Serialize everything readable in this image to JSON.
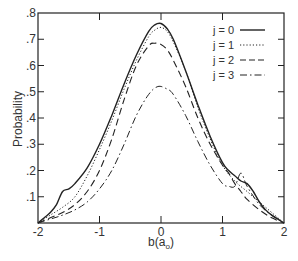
{
  "chart_data": {
    "type": "line",
    "title": "",
    "xlabel": "b(a₀)",
    "xlabel_main": "b(a",
    "xlabel_sub": "o",
    "xlabel_close": ")",
    "ylabel": "Probability",
    "xlim": [
      -2,
      2
    ],
    "ylim": [
      0,
      0.8
    ],
    "x_ticks": [
      -2,
      -1,
      0,
      1,
      2
    ],
    "x_tick_labels": [
      "-2",
      "-1",
      "0",
      "1",
      "2"
    ],
    "y_ticks": [
      0.1,
      0.2,
      0.3,
      0.4,
      0.5,
      0.6,
      0.7,
      0.8
    ],
    "y_tick_labels": [
      ".1",
      ".2",
      ".3",
      ".4",
      ".5",
      ".6",
      ".7",
      ".8"
    ],
    "grid": false,
    "legend_position": "top-right",
    "series": [
      {
        "name": "j = 0",
        "style": "solid",
        "x": [
          -2.0,
          -1.9,
          -1.8,
          -1.7,
          -1.6,
          -1.5,
          -1.4,
          -1.2,
          -1.0,
          -0.8,
          -0.6,
          -0.4,
          -0.2,
          -0.1,
          0.0,
          0.1,
          0.2,
          0.4,
          0.6,
          0.8,
          1.0,
          1.1,
          1.2,
          1.3,
          1.4,
          1.5,
          1.6,
          1.7,
          1.8,
          1.9,
          2.0
        ],
        "y": [
          0.0,
          0.02,
          0.04,
          0.07,
          0.12,
          0.13,
          0.15,
          0.21,
          0.3,
          0.41,
          0.53,
          0.64,
          0.73,
          0.755,
          0.76,
          0.74,
          0.7,
          0.58,
          0.45,
          0.33,
          0.23,
          0.2,
          0.18,
          0.16,
          0.15,
          0.12,
          0.08,
          0.05,
          0.03,
          0.015,
          0.0
        ]
      },
      {
        "name": "j = 1",
        "style": "dotted",
        "x": [
          -2.0,
          -1.8,
          -1.6,
          -1.4,
          -1.2,
          -1.0,
          -0.8,
          -0.6,
          -0.4,
          -0.2,
          -0.1,
          0.0,
          0.1,
          0.2,
          0.4,
          0.6,
          0.8,
          1.0,
          1.2,
          1.4,
          1.6,
          1.8,
          2.0
        ],
        "y": [
          0.0,
          0.03,
          0.06,
          0.1,
          0.18,
          0.28,
          0.39,
          0.51,
          0.62,
          0.71,
          0.735,
          0.745,
          0.73,
          0.69,
          0.58,
          0.44,
          0.32,
          0.22,
          0.16,
          0.12,
          0.08,
          0.04,
          0.0
        ]
      },
      {
        "name": "j = 2",
        "style": "dashed",
        "x": [
          -2.0,
          -1.8,
          -1.6,
          -1.4,
          -1.2,
          -1.0,
          -0.8,
          -0.6,
          -0.4,
          -0.2,
          -0.1,
          0.0,
          0.1,
          0.2,
          0.4,
          0.6,
          0.8,
          1.0,
          1.1,
          1.2,
          1.3,
          1.4,
          1.6,
          1.8,
          2.0
        ],
        "y": [
          0.0,
          0.02,
          0.04,
          0.07,
          0.12,
          0.2,
          0.32,
          0.47,
          0.6,
          0.675,
          0.685,
          0.68,
          0.66,
          0.62,
          0.52,
          0.4,
          0.3,
          0.22,
          0.19,
          0.15,
          0.12,
          0.09,
          0.05,
          0.02,
          0.0
        ]
      },
      {
        "name": "j = 3",
        "style": "dash-dot",
        "x": [
          -2.0,
          -1.8,
          -1.6,
          -1.4,
          -1.2,
          -1.0,
          -0.8,
          -0.6,
          -0.4,
          -0.2,
          -0.05,
          0.1,
          0.2,
          0.4,
          0.6,
          0.8,
          1.0,
          1.1,
          1.2,
          1.3,
          1.4,
          1.6,
          1.8,
          2.0
        ],
        "y": [
          0.0,
          0.015,
          0.03,
          0.05,
          0.08,
          0.13,
          0.2,
          0.3,
          0.41,
          0.49,
          0.52,
          0.51,
          0.49,
          0.41,
          0.31,
          0.22,
          0.15,
          0.14,
          0.14,
          0.19,
          0.14,
          0.07,
          0.03,
          0.0
        ]
      }
    ]
  },
  "colors": {
    "ink": "#222222",
    "background": "#ffffff"
  }
}
